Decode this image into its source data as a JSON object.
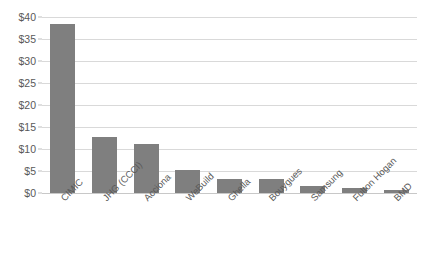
{
  "chart_data": {
    "type": "bar",
    "title": "",
    "xlabel": "",
    "ylabel": "",
    "categories": [
      "CIMIC",
      "JHG (CCCI)",
      "Acciona",
      "WeBuild",
      "Ghella",
      "Bouygues",
      "Samsung",
      "Fulton Hogan",
      "BMD"
    ],
    "values": [
      38.5,
      12.8,
      11.2,
      5.3,
      3.2,
      3.1,
      1.7,
      1.1,
      0.7
    ],
    "ytick_labels": [
      "$0",
      "$5",
      "$10",
      "$15",
      "$20",
      "$25",
      "$30",
      "$35",
      "$40"
    ],
    "ytick_values": [
      0,
      5,
      10,
      15,
      20,
      25,
      30,
      35,
      40
    ],
    "ylim": [
      0,
      40
    ],
    "grid": true,
    "legend": false,
    "series_color": "#7f7f7f",
    "gridline_color": "#d9d9d9",
    "background_color": "#ffffff"
  }
}
